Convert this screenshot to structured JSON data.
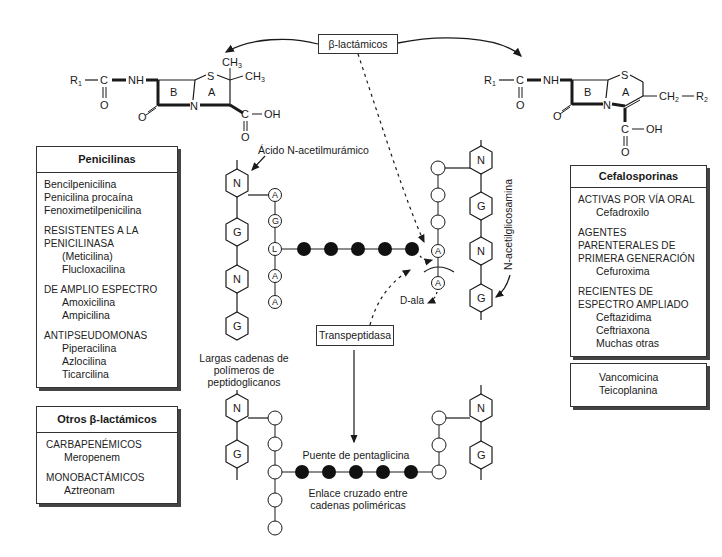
{
  "top_label": "β-lactámicos",
  "penicillin_structure": {
    "r1": "R",
    "r1_sub": "1",
    "c": "C",
    "o": "O",
    "nh": "NH",
    "ring_b": "B",
    "ring_a": "A",
    "s": "S",
    "n": "N",
    "ch3_top": "CH",
    "ch3_right": "CH",
    "sub3": "3",
    "cooh_c": "C",
    "oh": "OH",
    "ketone_o": "O",
    "cooh_o": "O"
  },
  "cephalosporin_structure": {
    "r1": "R",
    "r1_sub": "1",
    "c": "C",
    "o": "O",
    "nh": "NH",
    "ring_b": "B",
    "ring_a": "A",
    "s": "S",
    "n": "N",
    "ch2": "CH",
    "ch2_sub": "2",
    "r2": "R",
    "r2_sub": "2",
    "cooh_c": "C",
    "oh": "OH",
    "ketone_o": "O",
    "cooh_o": "O"
  },
  "penicilinas": {
    "title": "Penicilinas",
    "groups": [
      {
        "category": "",
        "items": [
          "Bencilpenicilina",
          "Penicilina procaína",
          "Fenoximetilpenicilina"
        ]
      },
      {
        "category": "RESISTENTES A LA PENICILINASA",
        "items": [
          "(Meticilina)",
          "Flucloxacilina"
        ]
      },
      {
        "category": "DE AMPLIO ESPECTRO",
        "items": [
          "Amoxicilina",
          "Ampicilina"
        ]
      },
      {
        "category": "ANTIPSEUDOMONAS",
        "items": [
          "Piperacilina",
          "Azlocilina",
          "Ticarcilina"
        ]
      }
    ]
  },
  "otros": {
    "title": "Otros β-lactámicos",
    "groups": [
      {
        "category": "CARBAPENÉMICOS",
        "items": [
          "Meropenem"
        ]
      },
      {
        "category": "MONOBACTÁMICOS",
        "items": [
          "Aztreonam"
        ]
      }
    ]
  },
  "cefalosporinas": {
    "title": "Cefalosporinas",
    "groups": [
      {
        "category": "ACTIVAS POR VÍA ORAL",
        "items": [
          "Cefadroxilo"
        ]
      },
      {
        "category": "AGENTES PARENTERALES  DE PRIMERA GENERACIÓN",
        "items": [
          "Cefuroxima"
        ]
      },
      {
        "category": "RECIENTES DE ESPECTRO AMPLIADO",
        "items": [
          "Ceftazidima",
          "Ceftriaxona",
          "Muchas otras"
        ]
      }
    ]
  },
  "glycopeptides": {
    "items": [
      "Vancomicina",
      "Teicoplanina"
    ]
  },
  "peptidoglycan": {
    "label_nam": "Ácido N-acetilmurámico",
    "label_nag": "N-acetilglicosamina",
    "label_chains": "Largas cadenas de polímeros de peptidoglicanos",
    "label_dala": "D-ala",
    "enzyme": "Transpeptidasa",
    "bridge_label": "Puente de pentaglicina",
    "crosslink_label": "Enlace cruzado entre cadenas poliméricas",
    "sugar_n": "N",
    "sugar_g": "G",
    "aa_a": "A",
    "aa_g": "G",
    "aa_l": "L"
  }
}
